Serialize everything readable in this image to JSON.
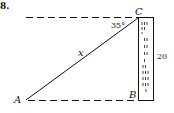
{
  "problem": {
    "number_label": "8."
  },
  "diagram": {
    "points": {
      "A": "A",
      "B": "B",
      "C": "C"
    },
    "hypotenuse_label": "x",
    "angle_label": "35°",
    "height_label": "20"
  }
}
